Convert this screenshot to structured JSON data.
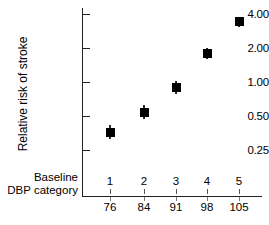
{
  "chart_data": {
    "type": "scatter",
    "title": "",
    "xlabel": "Baseline DBP category",
    "ylabel": "Relative risk of stroke",
    "yscale": "log",
    "ylim": [
      0.22,
      4.6
    ],
    "grid": false,
    "legend": "none",
    "categories": [
      "1",
      "2",
      "3",
      "4",
      "5"
    ],
    "x_value_labels": [
      "76",
      "84",
      "91",
      "98",
      "105"
    ],
    "y_ticks": [
      "0.25",
      "0.50",
      "1.00",
      "2.00",
      "4.00"
    ],
    "y_tick_values": [
      0.25,
      0.5,
      1.0,
      2.0,
      4.0
    ],
    "values": [
      0.36,
      0.54,
      0.9,
      1.8,
      3.4
    ],
    "error_low": [
      0.31,
      0.47,
      0.79,
      1.6,
      3.05
    ],
    "error_high": [
      0.42,
      0.62,
      1.03,
      2.02,
      3.78
    ],
    "marker": "filled-square",
    "marker_color": "#000000",
    "axis_color": "#222222",
    "background": "#ffffff",
    "points": [
      {
        "category": "1",
        "dbp": "76",
        "value": 0.36
      },
      {
        "category": "2",
        "dbp": "84",
        "value": 0.54
      },
      {
        "category": "3",
        "dbp": "91",
        "value": 0.9
      },
      {
        "category": "4",
        "dbp": "98",
        "value": 1.8
      },
      {
        "category": "5",
        "dbp": "105",
        "value": 3.4
      }
    ]
  },
  "axis": {
    "y_title": "Relative risk of stroke",
    "x_title_line1": "Baseline",
    "x_title_line2": "DBP category"
  }
}
